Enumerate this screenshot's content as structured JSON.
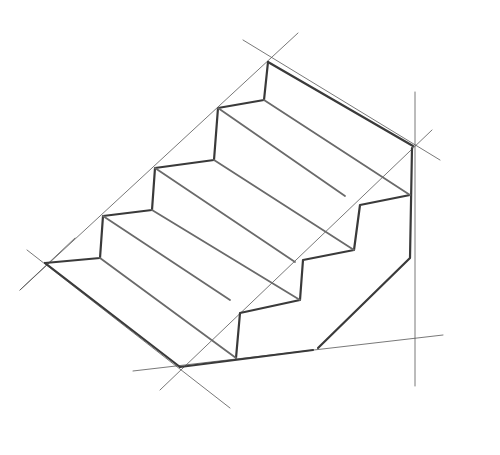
{
  "image": {
    "subject": "Pencil sketch of a staircase in two-point perspective with construction lines",
    "background_color": "#ffffff",
    "stroke_color": "#3a3a3a",
    "guide_color": "#555555"
  },
  "drawing": {
    "steps": 4,
    "guides": [
      {
        "name": "left-diagonal-guide",
        "points": [
          [
            20,
            290
          ],
          [
            298,
            33
          ]
        ]
      },
      {
        "name": "top-cross-guide",
        "points": [
          [
            243,
            40
          ],
          [
            440,
            160
          ]
        ]
      },
      {
        "name": "right-vertical-guide",
        "points": [
          [
            415,
            92
          ],
          [
            415,
            386
          ]
        ]
      },
      {
        "name": "right-diagonal-guide",
        "points": [
          [
            160,
            390
          ],
          [
            432,
            130
          ]
        ]
      },
      {
        "name": "base-line",
        "points": [
          [
            133,
            371
          ],
          [
            443,
            335
          ]
        ]
      },
      {
        "name": "bottom-cross-guide",
        "points": [
          [
            27,
            250
          ],
          [
            230,
            408
          ]
        ]
      },
      {
        "name": "lower-left-guide",
        "points": [
          [
            20,
            290
          ],
          [
            75,
            238
          ]
        ]
      }
    ],
    "edges": [
      {
        "name": "top-back-edge",
        "points": [
          [
            268,
            62
          ],
          [
            413,
            146
          ]
        ]
      },
      {
        "name": "left-step-profile",
        "points": [
          [
            268,
            62
          ],
          [
            264,
            100
          ],
          [
            218,
            108
          ],
          [
            214,
            160
          ],
          [
            155,
            168
          ],
          [
            152,
            210
          ],
          [
            103,
            216
          ],
          [
            100,
            258
          ],
          [
            45,
            263
          ]
        ]
      },
      {
        "name": "bottom-front-edge",
        "points": [
          [
            45,
            263
          ],
          [
            180,
            367
          ]
        ]
      },
      {
        "name": "base-edge",
        "points": [
          [
            180,
            367
          ],
          [
            313,
            350
          ]
        ]
      },
      {
        "name": "right-step-profile",
        "points": [
          [
            410,
            195
          ],
          [
            360,
            205
          ],
          [
            354,
            250
          ],
          [
            303,
            260
          ],
          [
            300,
            300
          ],
          [
            240,
            313
          ],
          [
            236,
            358
          ]
        ]
      },
      {
        "name": "right-wall-edge",
        "points": [
          [
            412,
            148
          ],
          [
            410,
            258
          ],
          [
            318,
            348
          ]
        ]
      }
    ],
    "tread_lines": [
      {
        "name": "tread-4-nosing",
        "points": [
          [
            264,
            100
          ],
          [
            410,
            195
          ]
        ]
      },
      {
        "name": "tread-4-back",
        "points": [
          [
            218,
            108
          ],
          [
            345,
            196
          ]
        ]
      },
      {
        "name": "tread-3-nosing",
        "points": [
          [
            214,
            160
          ],
          [
            354,
            250
          ]
        ]
      },
      {
        "name": "tread-3-back",
        "points": [
          [
            155,
            168
          ],
          [
            295,
            262
          ]
        ]
      },
      {
        "name": "tread-2-nosing",
        "points": [
          [
            152,
            210
          ],
          [
            300,
            300
          ]
        ]
      },
      {
        "name": "tread-2-back",
        "points": [
          [
            103,
            216
          ],
          [
            230,
            300
          ]
        ]
      },
      {
        "name": "tread-1-nosing",
        "points": [
          [
            100,
            258
          ],
          [
            236,
            358
          ]
        ]
      }
    ]
  }
}
